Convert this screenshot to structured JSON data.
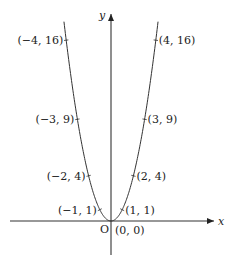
{
  "figure": {
    "axes": {
      "x_label": "x",
      "y_label": "y",
      "origin_label": "O",
      "origin_px": [
        111,
        221
      ],
      "unit_px": [
        11.2,
        11.3
      ],
      "x_range_px": [
        10,
        214
      ],
      "y_range_px": [
        255,
        14
      ]
    },
    "curve": {
      "equation": "y = x^2",
      "x_min": -4.2,
      "x_max": 4.2,
      "color": "#333333"
    },
    "points": [
      {
        "x": -4,
        "y": 16,
        "label": "(−4, 16)",
        "side": "left"
      },
      {
        "x": 4,
        "y": 16,
        "label": "(4, 16)",
        "side": "right"
      },
      {
        "x": -3,
        "y": 9,
        "label": "(−3, 9)",
        "side": "left"
      },
      {
        "x": 3,
        "y": 9,
        "label": "(3, 9)",
        "side": "right"
      },
      {
        "x": -2,
        "y": 4,
        "label": "(−2, 4)",
        "side": "left"
      },
      {
        "x": 2,
        "y": 4,
        "label": "(2, 4)",
        "side": "right"
      },
      {
        "x": -1,
        "y": 1,
        "label": "(−1, 1)",
        "side": "left"
      },
      {
        "x": 1,
        "y": 1,
        "label": "(1, 1)",
        "side": "right"
      },
      {
        "x": 0,
        "y": 0,
        "label": "(0, 0)",
        "side": "below-right"
      }
    ]
  }
}
